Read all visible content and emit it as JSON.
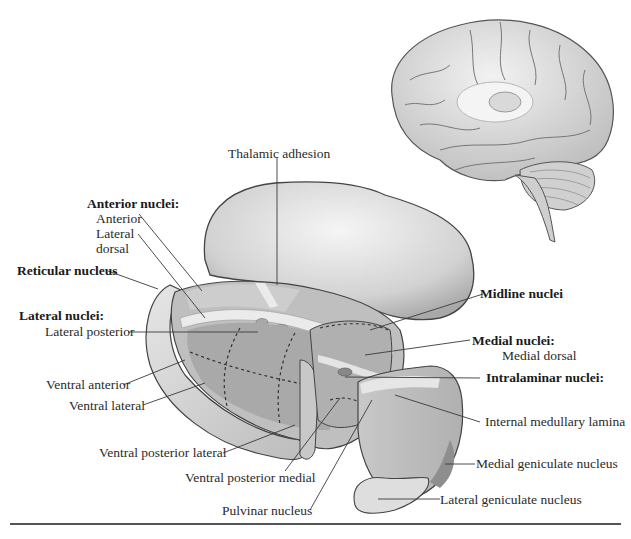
{
  "figure": {
    "colors": {
      "background": "#ffffff",
      "outline": "#4a4a4a",
      "thalamus_light": "#dcdcdc",
      "thalamus_mid": "#b8b8b8",
      "nucleus_dark": "#9a9a9a",
      "lamina": "#ececec",
      "leader_line": "#3a3a3a"
    },
    "labels": {
      "thalamic_adhesion": "Thalamic adhesion",
      "anterior_nuclei_heading": "Anterior nuclei:",
      "anterior": "Anterior",
      "lateral_dorsal_1": "Lateral",
      "lateral_dorsal_2": "dorsal",
      "reticular_nucleus": "Reticular nucleus",
      "lateral_nuclei_heading": "Lateral nuclei:",
      "lateral_posterior": "Lateral posterior",
      "ventral_anterior": "Ventral anterior",
      "ventral_lateral": "Ventral lateral",
      "ventral_posterior_lateral": "Ventral posterior lateral",
      "ventral_posterior_medial": "Ventral posterior medial",
      "pulvinar_nucleus": "Pulvinar nucleus",
      "midline_nuclei": "Midline nuclei",
      "medial_nuclei_heading": "Medial nuclei:",
      "medial_dorsal": "Medial dorsal",
      "intralaminar_nuclei": "Intralaminar nuclei:",
      "internal_medullary_lamina": "Internal medullary lamina",
      "medial_geniculate_nucleus": "Medial geniculate nucleus",
      "lateral_geniculate_nucleus": "Lateral geniculate nucleus"
    }
  }
}
